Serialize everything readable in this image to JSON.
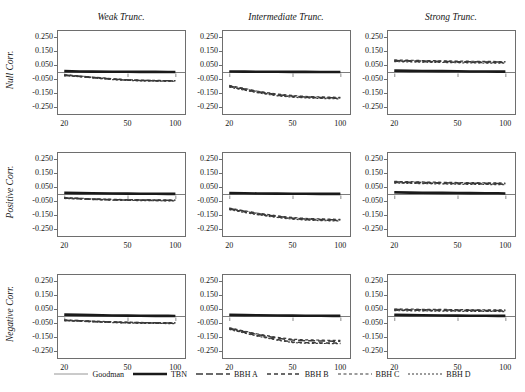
{
  "chart_data": {
    "type": "line",
    "title": "",
    "layout": {
      "rows": 3,
      "cols": 3,
      "grid": false,
      "legend_position": "bottom"
    },
    "col_titles": [
      "Weak Trunc.",
      "Intermediate Trunc.",
      "Strong Trunc."
    ],
    "row_titles": [
      "Null Corr.",
      "Positive Corr.",
      "Negative Corr."
    ],
    "xlabel": "",
    "ylabel": "",
    "x_scale": "log",
    "x_ticks": [
      20,
      50,
      100
    ],
    "x_tick_labels": [
      "20",
      "50",
      "100"
    ],
    "xlim": [
      18,
      115
    ],
    "y_ticks": [
      0.25,
      0.15,
      0.05,
      -0.05,
      -0.15,
      -0.25
    ],
    "y_tick_labels": [
      "0.250",
      "0.150",
      "0.050",
      "-0.050",
      "-0.150",
      "-0.250"
    ],
    "ylim": [
      -0.3,
      0.3
    ],
    "zero_reference_line": 0.0,
    "series_names": [
      "Goodman",
      "TBN",
      "BBH A",
      "BBH B",
      "BBH C",
      "BBH D"
    ],
    "x": [
      20,
      25,
      30,
      40,
      50,
      60,
      75,
      90,
      100
    ],
    "panels": [
      {
        "row": "Null Corr.",
        "col": "Weak Trunc.",
        "series": [
          {
            "name": "Goodman",
            "values": [
              0.0,
              0.0,
              0.0,
              0.0,
              0.0,
              0.0,
              0.0,
              0.0,
              0.0
            ]
          },
          {
            "name": "TBN",
            "values": [
              0.006,
              0.004,
              0.003,
              0.002,
              0.002,
              0.001,
              0.001,
              0.0,
              0.0
            ]
          },
          {
            "name": "BBH A",
            "values": [
              -0.022,
              -0.03,
              -0.038,
              -0.05,
              -0.057,
              -0.06,
              -0.062,
              -0.063,
              -0.063
            ]
          },
          {
            "name": "BBH B",
            "values": [
              -0.024,
              -0.032,
              -0.04,
              -0.052,
              -0.058,
              -0.061,
              -0.063,
              -0.064,
              -0.064
            ]
          },
          {
            "name": "BBH C",
            "values": [
              -0.02,
              -0.028,
              -0.036,
              -0.048,
              -0.055,
              -0.058,
              -0.06,
              -0.061,
              -0.061
            ]
          },
          {
            "name": "BBH D",
            "values": [
              -0.026,
              -0.034,
              -0.042,
              -0.054,
              -0.06,
              -0.063,
              -0.065,
              -0.066,
              -0.066
            ]
          }
        ]
      },
      {
        "row": "Null Corr.",
        "col": "Intermediate Trunc.",
        "series": [
          {
            "name": "Goodman",
            "values": [
              0.0,
              0.0,
              0.0,
              0.0,
              0.0,
              0.0,
              0.0,
              0.0,
              0.0
            ]
          },
          {
            "name": "TBN",
            "values": [
              0.004,
              0.003,
              0.002,
              0.002,
              0.001,
              0.001,
              0.0,
              0.0,
              0.0
            ]
          },
          {
            "name": "BBH A",
            "values": [
              -0.1,
              -0.122,
              -0.14,
              -0.162,
              -0.172,
              -0.178,
              -0.182,
              -0.184,
              -0.185
            ]
          },
          {
            "name": "BBH B",
            "values": [
              -0.104,
              -0.126,
              -0.144,
              -0.166,
              -0.176,
              -0.181,
              -0.185,
              -0.187,
              -0.188
            ]
          },
          {
            "name": "BBH C",
            "values": [
              -0.096,
              -0.118,
              -0.136,
              -0.158,
              -0.168,
              -0.174,
              -0.178,
              -0.18,
              -0.181
            ]
          },
          {
            "name": "BBH D",
            "values": [
              -0.108,
              -0.13,
              -0.148,
              -0.17,
              -0.18,
              -0.185,
              -0.189,
              -0.191,
              -0.192
            ]
          }
        ]
      },
      {
        "row": "Null Corr.",
        "col": "Strong Trunc.",
        "series": [
          {
            "name": "Goodman",
            "values": [
              0.0,
              0.0,
              0.0,
              0.0,
              0.0,
              0.0,
              0.0,
              0.0,
              0.0
            ]
          },
          {
            "name": "TBN",
            "values": [
              0.01,
              0.008,
              0.007,
              0.006,
              0.005,
              0.004,
              0.004,
              0.003,
              0.003
            ]
          },
          {
            "name": "BBH A",
            "values": [
              0.082,
              0.08,
              0.078,
              0.076,
              0.074,
              0.073,
              0.072,
              0.071,
              0.071
            ]
          },
          {
            "name": "BBH B",
            "values": [
              0.078,
              0.076,
              0.074,
              0.072,
              0.07,
              0.069,
              0.068,
              0.067,
              0.067
            ]
          },
          {
            "name": "BBH C",
            "values": [
              0.086,
              0.084,
              0.082,
              0.08,
              0.078,
              0.077,
              0.076,
              0.075,
              0.075
            ]
          },
          {
            "name": "BBH D",
            "values": [
              0.074,
              0.072,
              0.07,
              0.068,
              0.066,
              0.065,
              0.064,
              0.063,
              0.063
            ]
          }
        ]
      },
      {
        "row": "Positive Corr.",
        "col": "Weak Trunc.",
        "series": [
          {
            "name": "Goodman",
            "values": [
              0.0,
              0.0,
              0.0,
              0.0,
              0.0,
              0.0,
              0.0,
              0.0,
              0.0
            ]
          },
          {
            "name": "TBN",
            "values": [
              0.008,
              0.006,
              0.005,
              0.004,
              0.003,
              0.002,
              0.002,
              0.001,
              0.001
            ]
          },
          {
            "name": "BBH A",
            "values": [
              -0.028,
              -0.032,
              -0.036,
              -0.04,
              -0.042,
              -0.043,
              -0.044,
              -0.045,
              -0.045
            ]
          },
          {
            "name": "BBH B",
            "values": [
              -0.03,
              -0.034,
              -0.038,
              -0.042,
              -0.044,
              -0.045,
              -0.046,
              -0.047,
              -0.047
            ]
          },
          {
            "name": "BBH C",
            "values": [
              -0.026,
              -0.03,
              -0.034,
              -0.038,
              -0.04,
              -0.041,
              -0.042,
              -0.043,
              -0.043
            ]
          },
          {
            "name": "BBH D",
            "values": [
              -0.032,
              -0.036,
              -0.04,
              -0.044,
              -0.046,
              -0.047,
              -0.048,
              -0.049,
              -0.049
            ]
          }
        ]
      },
      {
        "row": "Positive Corr.",
        "col": "Intermediate Trunc.",
        "series": [
          {
            "name": "Goodman",
            "values": [
              0.0,
              0.0,
              0.0,
              0.0,
              0.0,
              0.0,
              0.0,
              0.0,
              0.0
            ]
          },
          {
            "name": "TBN",
            "values": [
              0.006,
              0.005,
              0.004,
              0.003,
              0.002,
              0.002,
              0.001,
              0.001,
              0.001
            ]
          },
          {
            "name": "BBH A",
            "values": [
              -0.104,
              -0.124,
              -0.14,
              -0.16,
              -0.172,
              -0.178,
              -0.182,
              -0.184,
              -0.185
            ]
          },
          {
            "name": "BBH B",
            "values": [
              -0.108,
              -0.128,
              -0.144,
              -0.164,
              -0.176,
              -0.182,
              -0.186,
              -0.188,
              -0.189
            ]
          },
          {
            "name": "BBH C",
            "values": [
              -0.1,
              -0.12,
              -0.136,
              -0.156,
              -0.168,
              -0.174,
              -0.178,
              -0.18,
              -0.181
            ]
          },
          {
            "name": "BBH D",
            "values": [
              -0.112,
              -0.132,
              -0.148,
              -0.168,
              -0.18,
              -0.186,
              -0.19,
              -0.192,
              -0.193
            ]
          }
        ]
      },
      {
        "row": "Positive Corr.",
        "col": "Strong Trunc.",
        "series": [
          {
            "name": "Goodman",
            "values": [
              0.0,
              0.0,
              0.0,
              0.0,
              0.0,
              0.0,
              0.0,
              0.0,
              0.0
            ]
          },
          {
            "name": "TBN",
            "values": [
              0.012,
              0.01,
              0.009,
              0.008,
              0.007,
              0.006,
              0.005,
              0.005,
              0.004
            ]
          },
          {
            "name": "BBH A",
            "values": [
              0.086,
              0.084,
              0.082,
              0.08,
              0.078,
              0.077,
              0.076,
              0.075,
              0.074
            ]
          },
          {
            "name": "BBH B",
            "values": [
              0.082,
              0.08,
              0.078,
              0.076,
              0.074,
              0.073,
              0.072,
              0.071,
              0.07
            ]
          },
          {
            "name": "BBH C",
            "values": [
              0.09,
              0.088,
              0.086,
              0.084,
              0.082,
              0.081,
              0.08,
              0.079,
              0.078
            ]
          },
          {
            "name": "BBH D",
            "values": [
              0.078,
              0.076,
              0.074,
              0.072,
              0.07,
              0.069,
              0.068,
              0.067,
              0.066
            ]
          }
        ]
      },
      {
        "row": "Negative Corr.",
        "col": "Weak Trunc.",
        "series": [
          {
            "name": "Goodman",
            "values": [
              0.0,
              0.0,
              0.0,
              0.0,
              0.0,
              0.0,
              0.0,
              0.0,
              0.0
            ]
          },
          {
            "name": "TBN",
            "values": [
              0.01,
              0.008,
              0.006,
              0.004,
              0.003,
              0.002,
              0.001,
              0.001,
              0.0
            ]
          },
          {
            "name": "BBH A",
            "values": [
              -0.03,
              -0.034,
              -0.038,
              -0.043,
              -0.046,
              -0.048,
              -0.049,
              -0.05,
              -0.05
            ]
          },
          {
            "name": "BBH B",
            "values": [
              -0.032,
              -0.036,
              -0.04,
              -0.045,
              -0.048,
              -0.05,
              -0.051,
              -0.052,
              -0.052
            ]
          },
          {
            "name": "BBH C",
            "values": [
              -0.028,
              -0.032,
              -0.036,
              -0.041,
              -0.044,
              -0.046,
              -0.047,
              -0.048,
              -0.048
            ]
          },
          {
            "name": "BBH D",
            "values": [
              -0.034,
              -0.038,
              -0.042,
              -0.047,
              -0.05,
              -0.052,
              -0.053,
              -0.054,
              -0.054
            ]
          }
        ]
      },
      {
        "row": "Negative Corr.",
        "col": "Intermediate Trunc.",
        "series": [
          {
            "name": "Goodman",
            "values": [
              0.0,
              0.0,
              0.0,
              0.0,
              0.0,
              0.0,
              0.0,
              0.0,
              0.0
            ]
          },
          {
            "name": "TBN",
            "values": [
              0.008,
              0.006,
              0.005,
              0.004,
              0.003,
              0.002,
              0.002,
              0.001,
              0.001
            ]
          },
          {
            "name": "BBH A",
            "values": [
              -0.088,
              -0.112,
              -0.132,
              -0.158,
              -0.172,
              -0.176,
              -0.178,
              -0.18,
              -0.18
            ]
          },
          {
            "name": "BBH B",
            "values": [
              -0.092,
              -0.118,
              -0.14,
              -0.168,
              -0.186,
              -0.19,
              -0.192,
              -0.193,
              -0.194
            ]
          },
          {
            "name": "BBH C",
            "values": [
              -0.084,
              -0.108,
              -0.128,
              -0.152,
              -0.166,
              -0.17,
              -0.172,
              -0.174,
              -0.174
            ]
          },
          {
            "name": "BBH D",
            "values": [
              -0.096,
              -0.122,
              -0.144,
              -0.172,
              -0.19,
              -0.194,
              -0.196,
              -0.197,
              -0.198
            ]
          }
        ]
      },
      {
        "row": "Negative Corr.",
        "col": "Strong Trunc.",
        "series": [
          {
            "name": "Goodman",
            "values": [
              0.0,
              0.0,
              0.0,
              0.0,
              0.0,
              0.0,
              0.0,
              0.0,
              0.0
            ]
          },
          {
            "name": "TBN",
            "values": [
              0.008,
              0.006,
              0.005,
              0.004,
              0.003,
              0.002,
              0.002,
              0.001,
              0.001
            ]
          },
          {
            "name": "BBH A",
            "values": [
              0.046,
              0.045,
              0.044,
              0.043,
              0.042,
              0.041,
              0.04,
              0.04,
              0.039
            ]
          },
          {
            "name": "BBH B",
            "values": [
              0.042,
              0.041,
              0.04,
              0.039,
              0.038,
              0.037,
              0.036,
              0.036,
              0.035
            ]
          },
          {
            "name": "BBH C",
            "values": [
              0.05,
              0.049,
              0.048,
              0.047,
              0.046,
              0.045,
              0.044,
              0.044,
              0.043
            ]
          },
          {
            "name": "BBH D",
            "values": [
              0.038,
              0.037,
              0.036,
              0.035,
              0.034,
              0.033,
              0.032,
              0.032,
              0.031
            ]
          }
        ]
      }
    ],
    "legend": [
      {
        "label": "Goodman",
        "style": "solid-thin",
        "color": "#8a8a8a"
      },
      {
        "label": "TBN",
        "style": "solid-thick",
        "color": "#1a1a1a"
      },
      {
        "label": "BBH A",
        "style": "dash-long",
        "color": "#3a3a3a"
      },
      {
        "label": "BBH B",
        "style": "dash-medium",
        "color": "#3a3a3a"
      },
      {
        "label": "BBH C",
        "style": "dash-short",
        "color": "#3a3a3a"
      },
      {
        "label": "BBH D",
        "style": "dash-fine",
        "color": "#3a3a3a"
      }
    ]
  },
  "colors": {
    "axis": "#6e6e6e",
    "text": "#141414",
    "goodman": "#8a8a8a",
    "tbn": "#1a1a1a",
    "bbh": "#3a3a3a",
    "background": "#ffffff"
  }
}
